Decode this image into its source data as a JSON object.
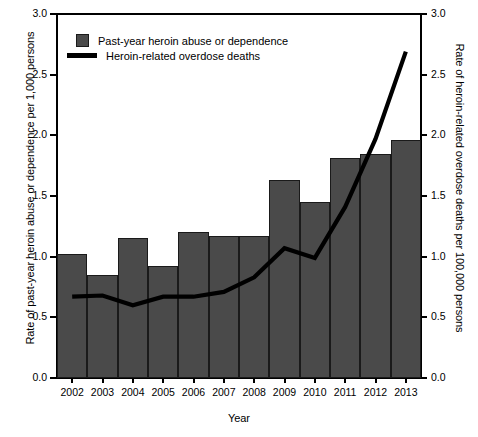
{
  "axes": {
    "y_left_title": "Rate of past-year heroin abuse or dependence per 1,000 persons",
    "y_right_title": "Rate of heroin-related overdose deaths per 100,000 persons",
    "x_title": "Year"
  },
  "legend": {
    "bars_label": "Past-year heroin abuse or dependence",
    "line_label": "Heroin-related overdose deaths"
  },
  "chart_data": {
    "type": "bar",
    "title": "",
    "xlabel": "Year",
    "ylabel": "Rate of past-year heroin abuse or dependence per 1,000 persons",
    "y2label": "Rate of heroin-related overdose deaths per 100,000 persons",
    "categories": [
      "2002",
      "2003",
      "2004",
      "2005",
      "2006",
      "2007",
      "2008",
      "2009",
      "2010",
      "2011",
      "2012",
      "2013"
    ],
    "ylim": [
      0.0,
      3.0
    ],
    "y2lim": [
      0.0,
      3.0
    ],
    "yticks": [
      "0.0",
      "0.5",
      "1.0",
      "1.5",
      "2.0",
      "2.5",
      "3.0"
    ],
    "ytick_values": [
      0.0,
      0.5,
      1.0,
      1.5,
      2.0,
      2.5,
      3.0
    ],
    "grid": false,
    "legend_position": "upper left",
    "series": [
      {
        "name": "Past-year heroin abuse or dependence",
        "kind": "bar",
        "axis": "left",
        "color": "#4a4a4a",
        "values": [
          1.02,
          0.85,
          1.15,
          0.92,
          1.2,
          1.17,
          1.17,
          1.63,
          1.45,
          1.81,
          1.85,
          1.96
        ]
      },
      {
        "name": "Heroin-related overdose deaths",
        "kind": "line",
        "axis": "right",
        "color": "#000000",
        "values": [
          0.67,
          0.68,
          0.6,
          0.67,
          0.67,
          0.71,
          0.83,
          1.07,
          0.99,
          1.41,
          1.97,
          2.69
        ]
      }
    ]
  }
}
